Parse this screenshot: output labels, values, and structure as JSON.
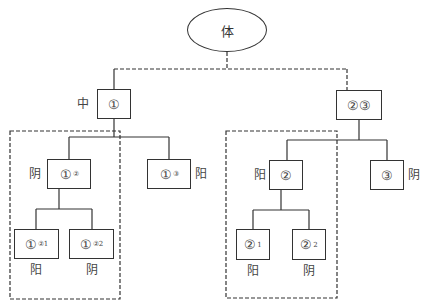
{
  "root": {
    "label": "体"
  },
  "nodes": {
    "n1": {
      "main": "①",
      "sub": "",
      "side_label": "中"
    },
    "n23": {
      "main": "②③",
      "sub": "",
      "side_label": ""
    },
    "n1_2": {
      "main": "①",
      "sub": "②",
      "side_label": "阴"
    },
    "n1_3": {
      "main": "①",
      "sub": "③",
      "side_label": "阳"
    },
    "n1_21": {
      "main": "①",
      "sub": "②1",
      "side_label": "阳"
    },
    "n1_22": {
      "main": "①",
      "sub": "②2",
      "side_label": "阴"
    },
    "n2": {
      "main": "②",
      "sub": "",
      "side_label": "阳"
    },
    "n3": {
      "main": "③",
      "sub": "",
      "side_label": "阴"
    },
    "n2_1": {
      "main": "②",
      "sub": "1",
      "side_label": "阳"
    },
    "n2_2": {
      "main": "②",
      "sub": "2",
      "side_label": "阴"
    }
  }
}
